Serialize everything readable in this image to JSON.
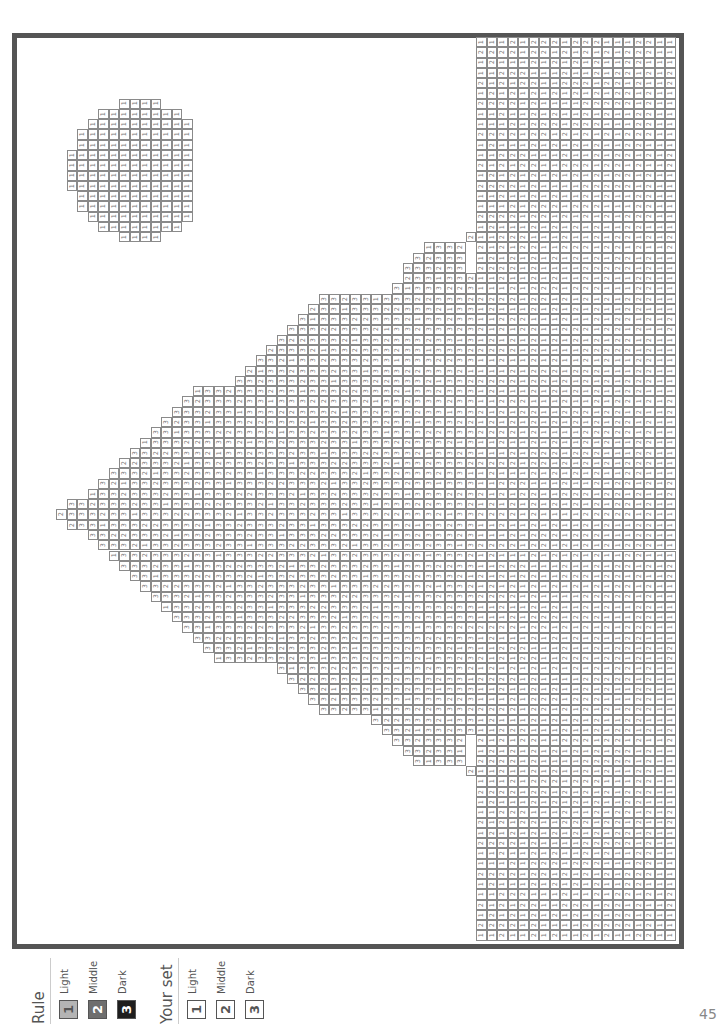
{
  "page_number": "45",
  "colors": {
    "frame": "#555555",
    "grid_line": "#8a8a8a",
    "light": "#b4b4b4",
    "middle": "#6e6e6e",
    "dark": "#1e1e1e"
  },
  "legend": {
    "rule": {
      "title": "Rule",
      "items": [
        {
          "number": "1",
          "label": "Light",
          "color": "#b4b4b4",
          "text_color": "#555555"
        },
        {
          "number": "2",
          "label": "Middle",
          "color": "#6e6e6e",
          "text_color": "#ffffff"
        },
        {
          "number": "3",
          "label": "Dark",
          "color": "#1e1e1e",
          "text_color": "#ffffff"
        }
      ]
    },
    "your_set": {
      "title": "Your set",
      "items": [
        {
          "number": "1",
          "label": "Light",
          "color": "#ffffff",
          "text_color": "#555555"
        },
        {
          "number": "2",
          "label": "Middle",
          "color": "#ffffff",
          "text_color": "#555555"
        },
        {
          "number": "3",
          "label": "Dark",
          "color": "#ffffff",
          "text_color": "#555555"
        }
      ]
    }
  },
  "grid": {
    "origin_x": 14,
    "origin_y": 37,
    "cell_w": 10.5,
    "cell_h": 10.27,
    "description": "Color-by-number picture (page rotated 90deg): a pine tree of 3s/2s/1s, a moon circle of 1s, and a ground strip of 1s/2s along the right edge.",
    "moon": {
      "value": "1",
      "rows": [
        {
          "r": 6,
          "c0": 10,
          "c1": 13
        },
        {
          "r": 7,
          "c0": 8,
          "c1": 15
        },
        {
          "r": 8,
          "c0": 7,
          "c1": 16
        },
        {
          "r": 9,
          "c0": 6,
          "c1": 16
        },
        {
          "r": 10,
          "c0": 6,
          "c1": 16
        },
        {
          "r": 11,
          "c0": 5,
          "c1": 16
        },
        {
          "r": 12,
          "c0": 5,
          "c1": 16
        },
        {
          "r": 13,
          "c0": 5,
          "c1": 16
        },
        {
          "r": 14,
          "c0": 5,
          "c1": 16
        },
        {
          "r": 15,
          "c0": 6,
          "c1": 16
        },
        {
          "r": 16,
          "c0": 6,
          "c1": 16
        },
        {
          "r": 17,
          "c0": 7,
          "c1": 16
        },
        {
          "r": 18,
          "c0": 8,
          "c1": 15
        },
        {
          "r": 19,
          "c0": 10,
          "c1": 13
        }
      ]
    },
    "ground": {
      "c0": 44,
      "c1": 62,
      "r0": 0,
      "r1": 87,
      "protrusions": [
        {
          "r": 19,
          "c": 43
        },
        {
          "r": 23,
          "c": 43
        },
        {
          "r": 71,
          "c": 43
        }
      ],
      "pattern_rows": [
        "1112122212221112211",
        "2222122121212122211",
        "1211121212121122111",
        "1122211121121221212",
        "2121221122212212112",
        "1212121212121221211",
        "2222121111222221211",
        "1121121211212112211"
      ]
    },
    "tree": {
      "row_spans": [
        {
          "r": 20,
          "c0": 39,
          "c1": 42
        },
        {
          "r": 21,
          "c0": 38,
          "c1": 42
        },
        {
          "r": 22,
          "c0": 37,
          "c1": 42
        },
        {
          "r": 23,
          "c0": 37,
          "c1": 42
        },
        {
          "r": 24,
          "c0": 36,
          "c1": 43
        },
        {
          "r": 25,
          "c0": 29,
          "c1": 43
        },
        {
          "r": 26,
          "c0": 28,
          "c1": 43
        },
        {
          "r": 27,
          "c0": 27,
          "c1": 43
        },
        {
          "r": 28,
          "c0": 26,
          "c1": 43
        },
        {
          "r": 29,
          "c0": 25,
          "c1": 43
        },
        {
          "r": 30,
          "c0": 24,
          "c1": 43
        },
        {
          "r": 31,
          "c0": 23,
          "c1": 43
        },
        {
          "r": 32,
          "c0": 22,
          "c1": 43
        },
        {
          "r": 33,
          "c0": 21,
          "c1": 43
        },
        {
          "r": 34,
          "c0": 17,
          "c1": 43
        },
        {
          "r": 35,
          "c0": 16,
          "c1": 43
        },
        {
          "r": 36,
          "c0": 15,
          "c1": 43
        },
        {
          "r": 37,
          "c0": 14,
          "c1": 43
        },
        {
          "r": 38,
          "c0": 13,
          "c1": 43
        },
        {
          "r": 39,
          "c0": 12,
          "c1": 43
        },
        {
          "r": 40,
          "c0": 11,
          "c1": 43
        },
        {
          "r": 41,
          "c0": 10,
          "c1": 43
        },
        {
          "r": 42,
          "c0": 9,
          "c1": 43
        },
        {
          "r": 43,
          "c0": 8,
          "c1": 43
        },
        {
          "r": 44,
          "c0": 7,
          "c1": 43
        },
        {
          "r": 45,
          "c0": 5,
          "c1": 43
        },
        {
          "r": 46,
          "c0": 4,
          "c1": 43
        },
        {
          "r": 47,
          "c0": 5,
          "c1": 43
        },
        {
          "r": 48,
          "c0": 7,
          "c1": 43
        },
        {
          "r": 49,
          "c0": 8,
          "c1": 43
        },
        {
          "r": 50,
          "c0": 9,
          "c1": 43
        },
        {
          "r": 51,
          "c0": 10,
          "c1": 43
        },
        {
          "r": 52,
          "c0": 11,
          "c1": 43
        },
        {
          "r": 53,
          "c0": 12,
          "c1": 43
        },
        {
          "r": 54,
          "c0": 13,
          "c1": 43
        },
        {
          "r": 55,
          "c0": 14,
          "c1": 43
        },
        {
          "r": 56,
          "c0": 15,
          "c1": 43
        },
        {
          "r": 57,
          "c0": 16,
          "c1": 43
        },
        {
          "r": 58,
          "c0": 17,
          "c1": 43
        },
        {
          "r": 59,
          "c0": 18,
          "c1": 43
        },
        {
          "r": 60,
          "c0": 19,
          "c1": 43
        },
        {
          "r": 61,
          "c0": 25,
          "c1": 43
        },
        {
          "r": 62,
          "c0": 26,
          "c1": 43
        },
        {
          "r": 63,
          "c0": 27,
          "c1": 43
        },
        {
          "r": 64,
          "c0": 28,
          "c1": 43
        },
        {
          "r": 65,
          "c0": 29,
          "c1": 43
        },
        {
          "r": 66,
          "c0": 34,
          "c1": 43
        },
        {
          "r": 67,
          "c0": 35,
          "c1": 43
        },
        {
          "r": 68,
          "c0": 36,
          "c1": 42
        },
        {
          "r": 69,
          "c0": 37,
          "c1": 42
        },
        {
          "r": 70,
          "c0": 38,
          "c1": 42
        }
      ],
      "pattern": "33233323313332233321"
    }
  }
}
